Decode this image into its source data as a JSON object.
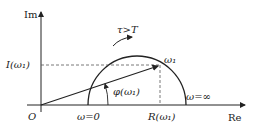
{
  "diagram": {
    "type": "nyquist-plot-semicircle",
    "axes": {
      "y_label": "Im",
      "x_label": "Re",
      "origin_label": "O"
    },
    "labels": {
      "imag_component": "I(ω₁)",
      "real_component": "R(ω₁)",
      "phase_angle": "φ(ω₁)",
      "point": "ω₁",
      "omega_zero": "ω=0",
      "omega_inf": "ω=∞",
      "direction": "τ>T"
    },
    "colors": {
      "line": "#222222",
      "dashed": "#555555",
      "background": "#ffffff"
    }
  }
}
